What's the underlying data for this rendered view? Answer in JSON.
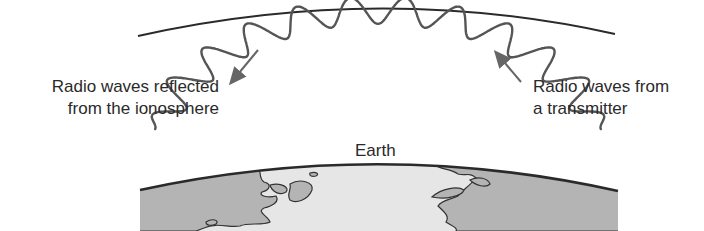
{
  "diagram": {
    "labels": {
      "reflected_line1": "Radio waves reflected",
      "reflected_line2": "from the ionosphere",
      "transmitter_line1": "Radio waves from",
      "transmitter_line2": "a transmitter",
      "earth": "Earth"
    },
    "colors": {
      "line": "#2a2a2a",
      "wave": "#555555",
      "arrow": "#666666",
      "ocean": "#e6e6e6",
      "land": "#b4b4b4",
      "coast": "#333333"
    },
    "ionosphere_arc": {
      "x1": 138,
      "y1": 36,
      "cx": 380,
      "cy": -18,
      "x2": 615,
      "y2": 34
    },
    "earth_arc": {
      "x1": 140,
      "y1": 190,
      "cx": 380,
      "cy": 138,
      "x2": 618,
      "y2": 191
    },
    "wave": {
      "center_x": 378,
      "center_y": 182,
      "radius": 165,
      "start_deg": 198,
      "end_deg": 342,
      "cycles": 11.5,
      "amplitude": 13
    }
  }
}
